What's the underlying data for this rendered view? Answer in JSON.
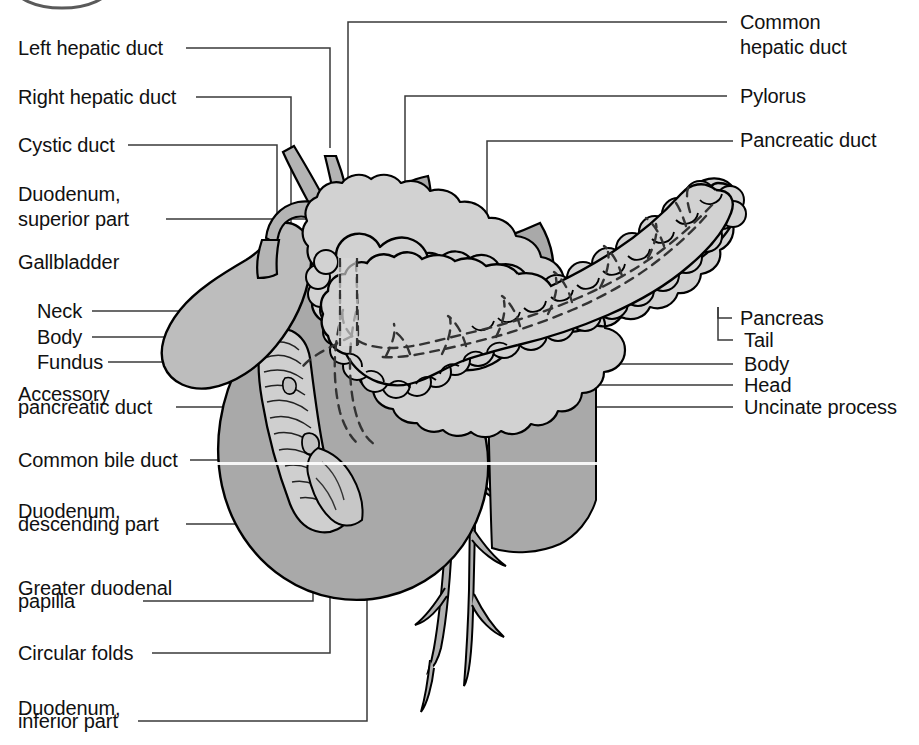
{
  "figure": {
    "width": 919,
    "height": 745,
    "background": "#ffffff"
  },
  "palette": {
    "ink": "#111111",
    "leader_line": "#3a3a3a",
    "outline": "#000000",
    "duodenum_fill": "#a9a9a9",
    "gallbladder_fill": "#bdbdbd",
    "pancreas_fill": "#d2d2d2",
    "duct_fill": "#b4b4b4",
    "vessel_fill": "#b0b0b0",
    "white": "#ffffff"
  },
  "labels_left": [
    {
      "id": "left-hepatic-duct",
      "text": "Left hepatic duct",
      "lines": [
        "Left hepatic duct"
      ]
    },
    {
      "id": "right-hepatic-duct",
      "text": "Right hepatic duct",
      "lines": [
        "Right hepatic duct"
      ]
    },
    {
      "id": "cystic-duct",
      "text": "Cystic duct",
      "lines": [
        "Cystic duct"
      ]
    },
    {
      "id": "duodenum-superior-part",
      "text": "Duodenum, superior part",
      "lines": [
        "Duodenum,",
        "superior part"
      ]
    },
    {
      "id": "gallbladder",
      "text": "Gallbladder",
      "lines": [
        "Gallbladder"
      ]
    },
    {
      "id": "gallbladder-neck",
      "text": "Neck",
      "lines": [
        "Neck"
      ]
    },
    {
      "id": "gallbladder-body",
      "text": "Body",
      "lines": [
        "Body"
      ]
    },
    {
      "id": "gallbladder-fundus",
      "text": "Fundus",
      "lines": [
        "Fundus"
      ]
    },
    {
      "id": "accessory-pancreatic-duct",
      "text": "Accessory pancreatic duct",
      "lines": [
        "Accessory",
        "pancreatic duct"
      ]
    },
    {
      "id": "common-bile-duct",
      "text": "Common bile duct",
      "lines": [
        "Common bile duct"
      ]
    },
    {
      "id": "duodenum-descending-part",
      "text": "Duodenum, descending part",
      "lines": [
        "Duodenum,",
        "descending part"
      ]
    },
    {
      "id": "greater-duodenal-papilla",
      "text": "Greater duodenal papilla",
      "lines": [
        "Greater duodenal",
        "papilla"
      ]
    },
    {
      "id": "circular-folds",
      "text": "Circular folds",
      "lines": [
        "Circular folds"
      ]
    },
    {
      "id": "duodenum-inferior-part",
      "text": "Duodenum, inferior part",
      "lines": [
        "Duodenum,",
        "inferior part"
      ]
    }
  ],
  "labels_right": [
    {
      "id": "common-hepatic-duct",
      "text": "Common hepatic duct",
      "lines": [
        "Common",
        "hepatic duct"
      ]
    },
    {
      "id": "pylorus",
      "text": "Pylorus",
      "lines": [
        "Pylorus"
      ]
    },
    {
      "id": "pancreatic-duct",
      "text": "Pancreatic duct",
      "lines": [
        "Pancreatic duct"
      ]
    },
    {
      "id": "pancreas",
      "text": "Pancreas",
      "lines": [
        "Pancreas"
      ]
    },
    {
      "id": "pancreas-tail",
      "text": "Tail",
      "lines": [
        "Tail"
      ]
    },
    {
      "id": "pancreas-body",
      "text": "Body",
      "lines": [
        "Body"
      ]
    },
    {
      "id": "pancreas-head",
      "text": "Head",
      "lines": [
        "Head"
      ]
    },
    {
      "id": "uncinate-process",
      "text": "Uncinate process",
      "lines": [
        "Uncinate process"
      ]
    }
  ],
  "text": {
    "left_hepatic_duct": "Left hepatic duct",
    "right_hepatic_duct": "Right hepatic duct",
    "cystic_duct": "Cystic duct",
    "duodenum_superior_1": "Duodenum,",
    "duodenum_superior_2": "superior part",
    "gallbladder": "Gallbladder",
    "neck": "Neck",
    "body_gb": "Body",
    "fundus": "Fundus",
    "accessory_1": "Accessory",
    "accessory_2": "pancreatic duct",
    "common_bile_duct": "Common bile duct",
    "duodenum_descending_1": "Duodenum,",
    "duodenum_descending_2": "descending part",
    "greater_papilla_1": "Greater duodenal",
    "greater_papilla_2": "papilla",
    "circular_folds": "Circular folds",
    "duodenum_inferior_1": "Duodenum,",
    "duodenum_inferior_2": "inferior part",
    "common_hepatic_1": "Common",
    "common_hepatic_2": "hepatic duct",
    "pylorus": "Pylorus",
    "pancreatic_duct": "Pancreatic duct",
    "pancreas": "Pancreas",
    "tail": "Tail",
    "body_p": "Body",
    "head": "Head",
    "uncinate_process": "Uncinate process"
  }
}
